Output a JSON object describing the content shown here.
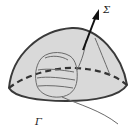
{
  "figure": {
    "surface_label": "Σ",
    "boundary_label": "Γ",
    "colors": {
      "surface_fill": "#d9d9d9",
      "outline": "#3a3a3a",
      "hand": "#6a6a6a",
      "arrow": "#111111"
    }
  }
}
